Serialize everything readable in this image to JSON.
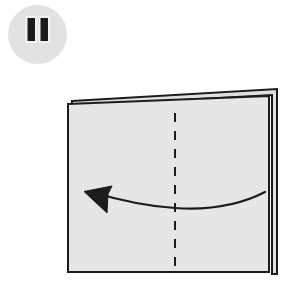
{
  "page": {
    "background_color": "#ffffff",
    "width": 304,
    "height": 281
  },
  "overlay": {
    "name": "pause-button",
    "state_label": "Paused",
    "icon": "pause-icon",
    "circle": {
      "cx": 30.5,
      "cy": 30.5,
      "r": 29.5,
      "fill": "#e2e2e2"
    },
    "bars": [
      {
        "x": 19.5,
        "y": 13.0,
        "w": 9.5,
        "h": 25.0
      },
      {
        "x": 32.5,
        "y": 13.0,
        "w": 9.5,
        "h": 25.0
      }
    ],
    "bar_fill": "#1a1a1a",
    "bar_stroke": "#f2f2f2"
  },
  "diagram": {
    "name": "origami-fold-step",
    "caption": "Fold the sheet in half from right to left along the dashed crease",
    "colors": {
      "paper_fill": "#e6e6e6",
      "paper_edge": "#1c1c1c",
      "back_sheet_fill": "#e0e0e0",
      "crease_line": "#1c1c1c",
      "arrow": "#1c1c1c"
    },
    "back_sheet": {
      "name": "back-sheet",
      "points": "72,101 277,89 277,274 272,274 272,95 72,106",
      "label": "Back half of the folded sheet"
    },
    "front_sheet": {
      "name": "front-sheet",
      "points": "68,104 269,96 269,272 68,272",
      "label": "Front half of the folded sheet"
    },
    "crease": {
      "name": "fold-crease-line",
      "x": 175,
      "y1": 113,
      "y2": 269,
      "dash": "9 9",
      "width": 2.0,
      "label": "Dashed fold line (vertical center crease)"
    },
    "arrow": {
      "name": "fold-direction-arrow",
      "direction": "right-to-left",
      "path": "M 265 192 C 236 207, 205 210, 175 208 C 145 206, 115 199, 92 192",
      "head": "M 84 191.5 L 112 186 L 108 194 L 107 213 Z",
      "stroke_width": 2.2,
      "label": "Curved arrow indicating fold direction to the left"
    }
  }
}
